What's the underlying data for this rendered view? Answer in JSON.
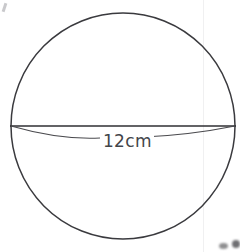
{
  "figure": {
    "shape": "sphere",
    "background_color": "#ffffff",
    "stroke_color": "#3a3a3e",
    "stroke_width": 1.5,
    "label": {
      "text": "12cm",
      "value": 12,
      "unit": "cm",
      "measures": "diameter",
      "color": "#43454a"
    },
    "circle": {
      "center_x": 123,
      "center_y": 126,
      "radius_x": 112,
      "radius_y": 113
    },
    "equator_arc": {
      "left_x": 11,
      "right_x": 235,
      "y": 126,
      "sag": 11
    },
    "diameter_line": {
      "x1": 10,
      "x2": 236,
      "y": 126
    },
    "artifacts": {
      "scan_seam_x": 203,
      "smudge_count": 2,
      "corner_mark": "top-left"
    }
  }
}
